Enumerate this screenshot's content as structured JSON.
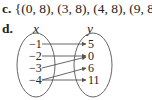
{
  "item_c": {
    "label": "c.",
    "text": "{(0, 8), (3, 8), (4, 8), (9, 8)}"
  },
  "item_d": {
    "label": "d.",
    "domain_header": "x",
    "range_header": "y",
    "domain": [
      "−1",
      "−2",
      "−3",
      "−4"
    ],
    "range": [
      "5",
      "0",
      "6",
      "11"
    ],
    "mappings": [
      {
        "from": "−1",
        "to": "5"
      },
      {
        "from": "−2",
        "to": "0"
      },
      {
        "from": "−3",
        "to": "0"
      },
      {
        "from": "−4",
        "to": "6"
      },
      {
        "from": "−4",
        "to": "11"
      }
    ]
  }
}
